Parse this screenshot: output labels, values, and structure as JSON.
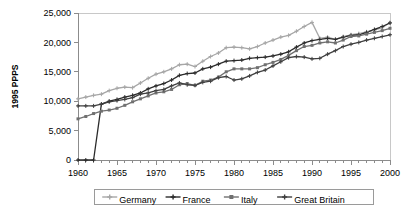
{
  "chart_data": {
    "type": "line",
    "title": "",
    "xlabel": "",
    "ylabel": "1995 PPPS",
    "xlim": [
      1960,
      2000
    ],
    "ylim": [
      0,
      25000
    ],
    "grid": false,
    "legend_position": "bottom",
    "x_ticks": [
      "1960",
      "1965",
      "1970",
      "1975",
      "1980",
      "1985",
      "1990",
      "1995",
      "2000"
    ],
    "x_tick_values": [
      1960,
      1965,
      1970,
      1975,
      1980,
      1985,
      1990,
      1995,
      2000
    ],
    "x_minor_step": 1,
    "y_ticks": [
      "0",
      "5,000",
      "10,000",
      "15,000",
      "20,000",
      "25,000"
    ],
    "y_tick_values": [
      0,
      5000,
      10000,
      15000,
      20000,
      25000
    ],
    "x": [
      1960,
      1961,
      1962,
      1963,
      1964,
      1965,
      1966,
      1967,
      1968,
      1969,
      1970,
      1971,
      1972,
      1973,
      1974,
      1975,
      1976,
      1977,
      1978,
      1979,
      1980,
      1981,
      1982,
      1983,
      1984,
      1985,
      1986,
      1987,
      1988,
      1989,
      1990,
      1991,
      1992,
      1993,
      1994,
      1995,
      1996,
      1997,
      1998,
      1999,
      2000
    ],
    "series": [
      {
        "name": "Germany",
        "color": "#a6a6a6",
        "marker": "plus",
        "values": [
          10400,
          10700,
          11000,
          11200,
          11800,
          12200,
          12400,
          12300,
          13100,
          13900,
          14600,
          15000,
          15500,
          16200,
          16300,
          15900,
          16800,
          17600,
          18200,
          19100,
          19200,
          19100,
          18900,
          19300,
          19900,
          20400,
          20900,
          21200,
          21900,
          22700,
          23400,
          20700,
          20900,
          20500,
          21000,
          21300,
          21500,
          21800,
          22100,
          22500,
          23400
        ]
      },
      {
        "name": "France",
        "color": "#2b2b2b",
        "marker": "plus",
        "values": [
          0,
          0,
          0,
          9500,
          10000,
          10300,
          10700,
          11000,
          11400,
          12100,
          12600,
          13000,
          13600,
          14400,
          14700,
          14800,
          15500,
          15800,
          16300,
          16800,
          16900,
          17000,
          17300,
          17400,
          17500,
          17700,
          18000,
          18400,
          19200,
          19900,
          20300,
          20500,
          20700,
          20500,
          20900,
          21200,
          21300,
          21700,
          22200,
          22700,
          23300
        ]
      },
      {
        "name": "Italy",
        "color": "#707070",
        "marker": "square",
        "values": [
          7000,
          7400,
          7900,
          8300,
          8500,
          8800,
          9300,
          9900,
          10400,
          10900,
          11400,
          11600,
          12000,
          12800,
          13000,
          12700,
          13400,
          13600,
          14100,
          15000,
          15500,
          15500,
          15500,
          15700,
          16200,
          16600,
          17100,
          17800,
          18600,
          19300,
          19500,
          19900,
          20100,
          19900,
          20400,
          21000,
          21100,
          21400,
          21700,
          22000,
          22400
        ]
      },
      {
        "name": "Great Britain",
        "color": "#3f3f3f",
        "marker": "plus",
        "values": [
          9200,
          9200,
          9200,
          9500,
          9900,
          10100,
          10300,
          10600,
          11200,
          11400,
          11800,
          12000,
          12600,
          13100,
          12800,
          12700,
          13200,
          13400,
          14000,
          14200,
          13600,
          13800,
          14300,
          14900,
          15300,
          16000,
          16700,
          17400,
          17600,
          17500,
          17200,
          17300,
          18000,
          18600,
          19300,
          19700,
          20000,
          20400,
          20700,
          21000,
          21300
        ]
      }
    ],
    "legend": [
      {
        "label": "Germany",
        "color": "#a6a6a6",
        "marker": "plus"
      },
      {
        "label": "France",
        "color": "#2b2b2b",
        "marker": "plus"
      },
      {
        "label": "Italy",
        "color": "#707070",
        "marker": "square"
      },
      {
        "label": "Great Britain",
        "color": "#3f3f3f",
        "marker": "plus"
      }
    ]
  }
}
